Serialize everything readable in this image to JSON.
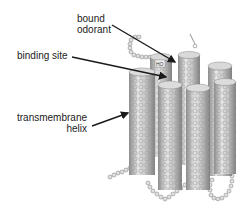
{
  "labels": {
    "bound_odorant": [
      "bound",
      "odorant"
    ],
    "binding_site": "binding site",
    "transmembrane_helix": [
      "transmembrane",
      "helix"
    ],
    "ligand_marker": "HO"
  },
  "colors": {
    "helix_light": "#e6e6e6",
    "helix_mid": "#b5b5b5",
    "helix_dark": "#8a8a8a",
    "bead": "#d4d4d4",
    "bead_stroke": "#8c8c8c",
    "arrow": "#1a1a1a",
    "text": "#222222"
  }
}
